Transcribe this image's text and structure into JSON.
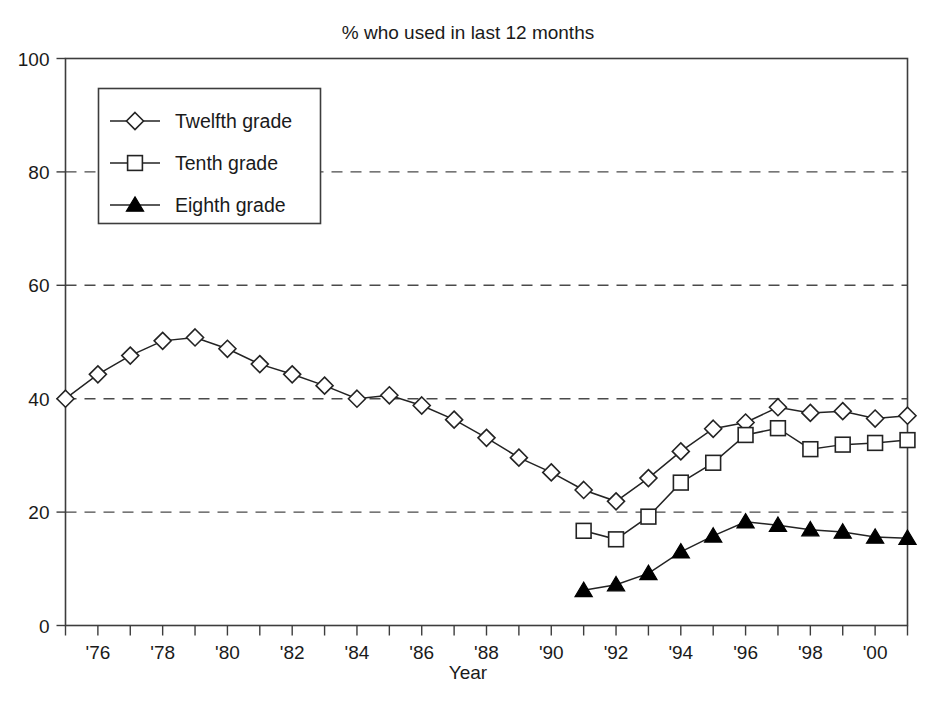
{
  "chart_data": {
    "type": "line",
    "title": "% who used in last 12 months",
    "xlabel": "Year",
    "ylabel": "",
    "xlim": [
      1975,
      2001
    ],
    "ylim": [
      0,
      100
    ],
    "grid": true,
    "legend_position": "top-left",
    "y_ticks": [
      0,
      20,
      40,
      60,
      80,
      100
    ],
    "y_tick_labels": [
      "0",
      "20",
      "40",
      "60",
      "80",
      "100"
    ],
    "gridline_values": [
      20,
      40,
      60,
      80
    ],
    "x_ticks": [
      1975,
      1976,
      1977,
      1978,
      1979,
      1980,
      1981,
      1982,
      1983,
      1984,
      1985,
      1986,
      1987,
      1988,
      1989,
      1990,
      1991,
      1992,
      1993,
      1994,
      1995,
      1996,
      1997,
      1998,
      1999,
      2000,
      2001
    ],
    "x_tick_labels": [
      {
        "x": 1976,
        "label": "'76"
      },
      {
        "x": 1978,
        "label": "'78"
      },
      {
        "x": 1980,
        "label": "'80"
      },
      {
        "x": 1982,
        "label": "'82"
      },
      {
        "x": 1984,
        "label": "'84"
      },
      {
        "x": 1986,
        "label": "'86"
      },
      {
        "x": 1988,
        "label": "'88"
      },
      {
        "x": 1990,
        "label": "'90"
      },
      {
        "x": 1992,
        "label": "'92"
      },
      {
        "x": 1994,
        "label": "'94"
      },
      {
        "x": 1996,
        "label": "'96"
      },
      {
        "x": 1998,
        "label": "'98"
      },
      {
        "x": 2000,
        "label": "'00"
      }
    ],
    "series": [
      {
        "name": "Twelfth grade",
        "marker": "diamond-open",
        "x": [
          1975,
          1976,
          1977,
          1978,
          1979,
          1980,
          1981,
          1982,
          1983,
          1984,
          1985,
          1986,
          1987,
          1988,
          1989,
          1990,
          1991,
          1992,
          1993,
          1994,
          1995,
          1996,
          1997,
          1998,
          1999,
          2000,
          2001
        ],
        "values": [
          40.0,
          44.3,
          47.6,
          50.2,
          50.8,
          48.8,
          46.1,
          44.3,
          42.3,
          40.0,
          40.6,
          38.8,
          36.3,
          33.1,
          29.6,
          27.0,
          23.9,
          21.9,
          26.0,
          30.7,
          34.7,
          35.8,
          38.5,
          37.5,
          37.8,
          36.5,
          37.0
        ]
      },
      {
        "name": "Tenth grade",
        "marker": "square-open",
        "x": [
          1991,
          1992,
          1993,
          1994,
          1995,
          1996,
          1997,
          1998,
          1999,
          2000,
          2001
        ],
        "values": [
          16.7,
          15.2,
          19.2,
          25.2,
          28.7,
          33.6,
          34.8,
          31.1,
          31.9,
          32.2,
          32.7
        ]
      },
      {
        "name": "Eighth grade",
        "marker": "triangle-filled",
        "x": [
          1991,
          1992,
          1993,
          1994,
          1995,
          1996,
          1997,
          1998,
          1999,
          2000,
          2001
        ],
        "values": [
          6.2,
          7.2,
          9.2,
          13.0,
          15.8,
          18.3,
          17.7,
          16.9,
          16.5,
          15.6,
          15.4
        ]
      }
    ]
  },
  "legend": {
    "entries": [
      {
        "label": "Twelfth grade",
        "marker": "diamond-open"
      },
      {
        "label": "Tenth grade",
        "marker": "square-open"
      },
      {
        "label": "Eighth grade",
        "marker": "triangle-filled"
      }
    ]
  },
  "colors": {
    "line": "#232323",
    "frame": "#3d3d3d",
    "grid": "#4a4a4a",
    "text": "#1a1a1a",
    "background": "#ffffff"
  }
}
